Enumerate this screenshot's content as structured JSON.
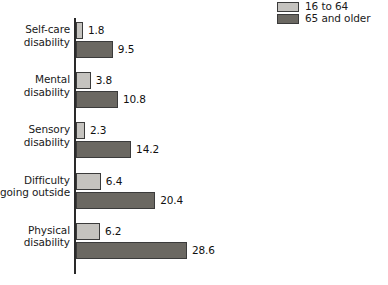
{
  "legend": {
    "position": "top-right",
    "items": [
      {
        "label": "16 to 64",
        "color": "#c5c3bf"
      },
      {
        "label": "65 and older",
        "color": "#6b6862"
      }
    ]
  },
  "chart_data": {
    "type": "bar",
    "orientation": "horizontal",
    "title": "",
    "subtitle": "",
    "xlabel": "",
    "ylabel": "",
    "grid": false,
    "legend_position": "top-right",
    "xlim": [
      0,
      28.6
    ],
    "categories": [
      "Self-care disability",
      "Mental disability",
      "Sensory disability",
      "Difficulty going outside",
      "Physical disability"
    ],
    "category_lines": [
      [
        "Self-care",
        "disability"
      ],
      [
        "Mental",
        "disability"
      ],
      [
        "Sensory",
        "disability"
      ],
      [
        "Difficulty",
        "going outside"
      ],
      [
        "Physical",
        "disability"
      ]
    ],
    "series": [
      {
        "name": "16 to 64",
        "color": "#c5c3bf",
        "values": [
          1.8,
          3.8,
          2.3,
          6.4,
          6.2
        ]
      },
      {
        "name": "65 and older",
        "color": "#6b6862",
        "values": [
          9.5,
          10.8,
          14.2,
          20.4,
          28.6
        ]
      }
    ]
  },
  "groups": [
    {
      "label_line1": "Self-care",
      "label_line2": "disability",
      "light_value": "1.8",
      "dark_value": "9.5"
    },
    {
      "label_line1": "Mental",
      "label_line2": "disability",
      "light_value": "3.8",
      "dark_value": "10.8"
    },
    {
      "label_line1": "Sensory",
      "label_line2": "disability",
      "light_value": "2.3",
      "dark_value": "14.2"
    },
    {
      "label_line1": "Difficulty",
      "label_line2": "going outside",
      "light_value": "6.4",
      "dark_value": "20.4"
    },
    {
      "label_line1": "Physical",
      "label_line2": "disability",
      "light_value": "6.2",
      "dark_value": "28.6"
    }
  ]
}
